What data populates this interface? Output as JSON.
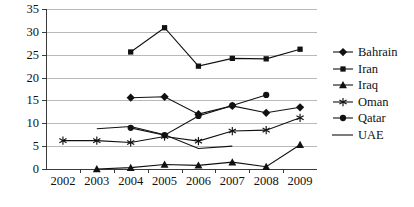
{
  "chart_data": {
    "type": "line",
    "title": "",
    "subtitle": "",
    "xlabel": "",
    "ylabel": "",
    "categories": [
      "2002",
      "2003",
      "2004",
      "2005",
      "2006",
      "2007",
      "2008",
      "2009"
    ],
    "ylim": [
      0,
      35
    ],
    "ytick_values": [
      0,
      5,
      10,
      15,
      20,
      25,
      30,
      35
    ],
    "ytick_labels": [
      "0",
      "5",
      "10",
      "15",
      "20",
      "25",
      "30",
      "35"
    ],
    "grid": true,
    "grid_axis": "y",
    "legend_position": "right",
    "series": [
      {
        "name": "Bahrain",
        "marker": "diamond",
        "x": [
          "2004",
          "2005",
          "2006",
          "2007",
          "2008",
          "2009"
        ],
        "values": [
          15.6,
          15.8,
          12.0,
          13.8,
          12.3,
          13.5
        ]
      },
      {
        "name": "Iran",
        "marker": "square",
        "x": [
          "2004",
          "2005",
          "2006",
          "2007",
          "2008",
          "2009"
        ],
        "values": [
          25.6,
          30.9,
          22.5,
          24.2,
          24.1,
          26.2
        ]
      },
      {
        "name": "Iraq",
        "marker": "triangle",
        "x": [
          "2003",
          "2004",
          "2005",
          "2006",
          "2007",
          "2008",
          "2009"
        ],
        "values": [
          0.0,
          0.3,
          1.0,
          0.8,
          1.5,
          0.5,
          5.3
        ]
      },
      {
        "name": "Oman",
        "marker": "asterisk",
        "x": [
          "2002",
          "2003",
          "2004",
          "2005",
          "2006",
          "2007",
          "2008",
          "2009"
        ],
        "values": [
          6.2,
          6.2,
          5.8,
          7.1,
          6.1,
          8.3,
          8.5,
          11.2
        ]
      },
      {
        "name": "Qatar",
        "marker": "circle",
        "x": [
          "2004",
          "2005",
          "2006",
          "2007",
          "2008"
        ],
        "values": [
          9.0,
          7.4,
          11.6,
          13.9,
          16.2
        ]
      },
      {
        "name": "UAE",
        "marker": "none",
        "x": [
          "2003",
          "2004",
          "2005",
          "2006",
          "2007"
        ],
        "values": [
          8.8,
          9.3,
          7.5,
          4.5,
          5.0
        ]
      }
    ]
  },
  "legend": {
    "entries": [
      {
        "label": "Bahrain",
        "marker": "diamond"
      },
      {
        "label": "Iran",
        "marker": "square"
      },
      {
        "label": "Iraq",
        "marker": "triangle"
      },
      {
        "label": "Oman",
        "marker": "asterisk"
      },
      {
        "label": "Qatar",
        "marker": "circle"
      },
      {
        "label": "UAE",
        "marker": "none"
      }
    ]
  },
  "colors": {
    "ink": "#111111",
    "gridline": "#b9b9b9",
    "axis": "#3a3a3a",
    "background": "#ffffff"
  }
}
